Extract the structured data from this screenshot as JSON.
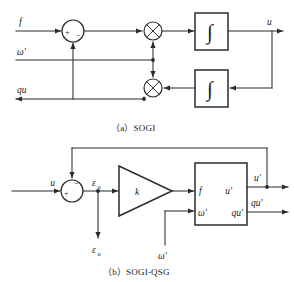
{
  "figure": {
    "panels": [
      {
        "id": "sogi",
        "caption": "（a）SOGI",
        "inputs": [
          {
            "name": "f",
            "label": "f"
          },
          {
            "name": "omega-prime",
            "label": "ω′"
          },
          {
            "name": "qu",
            "label": "qu"
          }
        ],
        "outputs": [
          {
            "name": "u",
            "label": "u"
          }
        ],
        "sum_junction": {
          "name": "summing-junction",
          "sign_left": "+",
          "sign_bottom": "−"
        },
        "multipliers": [
          {
            "name": "multiplier-top",
            "glyph": "×"
          },
          {
            "name": "multiplier-bottom",
            "glyph": "×"
          }
        ],
        "blocks": [
          {
            "name": "integrator-top",
            "label": "∫"
          },
          {
            "name": "integrator-bottom",
            "label": "∫"
          }
        ]
      },
      {
        "id": "sogi-qsg",
        "caption": "（b）SOGI-QSG",
        "inputs": [
          {
            "name": "u",
            "label": "u"
          },
          {
            "name": "omega-prime",
            "label": "ω′"
          }
        ],
        "outputs": [
          {
            "name": "u-prime",
            "label": "u′"
          },
          {
            "name": "qu-prime",
            "label": "qu′"
          },
          {
            "name": "epsilon-u",
            "label": "ε",
            "subscript": "u"
          }
        ],
        "sum_junction": {
          "name": "summing-junction",
          "sign_left": "+",
          "sign_top": "−"
        },
        "error_signal": {
          "name": "epsilon-u-signal",
          "label": "ε",
          "subscript": "u"
        },
        "gain": {
          "name": "gain-block",
          "label": "k"
        },
        "sogi_block": {
          "name": "sogi-block",
          "input_top": "f",
          "input_bottom": "ω′",
          "output_top": "u′",
          "output_bottom": "qu′"
        }
      }
    ]
  },
  "colors": {
    "stroke": "#2b2b2b",
    "text": "#1a1a1a",
    "background": "#ffffff"
  }
}
